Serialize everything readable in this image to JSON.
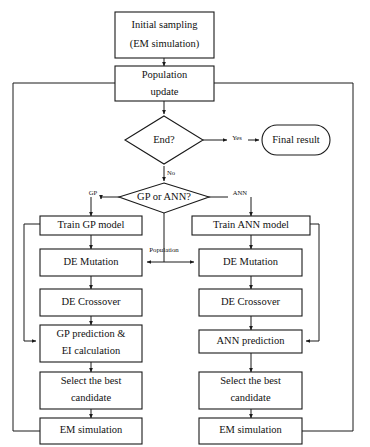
{
  "diagram": {
    "nodes": {
      "initial_sampling": {
        "line1": "Initial sampling",
        "line2": "(EM simulation)",
        "shape": "rect"
      },
      "population_update": {
        "line1": "Population",
        "line2": "update",
        "shape": "rect"
      },
      "end_decision": {
        "line1": "End?",
        "shape": "diamond"
      },
      "final_result": {
        "line1": "Final result",
        "shape": "stadium"
      },
      "model_decision": {
        "line1": "GP or ANN?",
        "shape": "diamond"
      },
      "train_gp": {
        "line1": "Train GP model",
        "shape": "rect"
      },
      "train_ann": {
        "line1": "Train ANN model",
        "shape": "rect"
      },
      "de_mutation_left": {
        "line1": "DE Mutation",
        "shape": "rect"
      },
      "de_mutation_right": {
        "line1": "DE Mutation",
        "shape": "rect"
      },
      "de_crossover_left": {
        "line1": "DE Crossover",
        "shape": "rect"
      },
      "de_crossover_right": {
        "line1": "DE Crossover",
        "shape": "rect"
      },
      "gp_prediction": {
        "line1": "GP prediction &",
        "line2": "EI calculation",
        "shape": "rect"
      },
      "ann_prediction": {
        "line1": "ANN prediction",
        "shape": "rect"
      },
      "select_best_left": {
        "line1": "Select the best",
        "line2": "candidate",
        "shape": "rect"
      },
      "select_best_right": {
        "line1": "Select the best",
        "line2": "candidate",
        "shape": "rect"
      },
      "em_simulation_left": {
        "line1": "EM simulation",
        "shape": "rect"
      },
      "em_simulation_right": {
        "line1": "EM simulation",
        "shape": "rect"
      }
    },
    "edge_labels": {
      "yes": "Yes",
      "no": "No",
      "gp": "GP",
      "ann": "ANN",
      "population": "Population"
    },
    "colors": {
      "stroke": "#1a1a1a",
      "fill": "#ffffff",
      "text": "#111111"
    }
  }
}
